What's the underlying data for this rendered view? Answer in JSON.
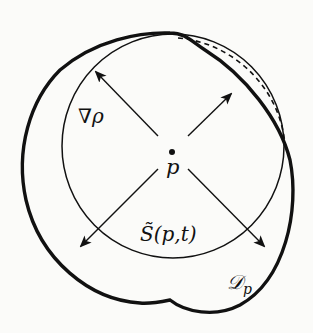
{
  "diagram": {
    "center_point": {
      "label": "p"
    },
    "gradient_label": "∇ρ",
    "surface_label": "S̃(p,t)",
    "domain_label": {
      "main": "𝒟",
      "sub": "p"
    },
    "colors": {
      "stroke": "#111111",
      "background": "#fbfbf9"
    },
    "arrows": [
      "north-west",
      "north-east",
      "south-west",
      "south-east"
    ],
    "shapes": [
      "thin circle S̃(p,t)",
      "thick outer region 𝒟p",
      "dashed arc (top-right)"
    ]
  }
}
